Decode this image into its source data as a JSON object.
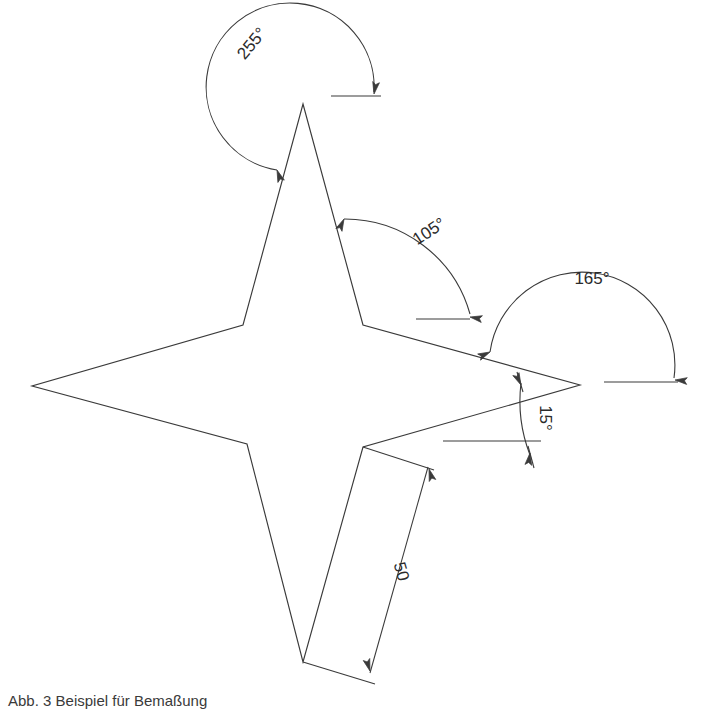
{
  "document": {
    "type": "engineering-line-drawing",
    "background_color": "#ffffff",
    "line_color": "#3a3a3a",
    "text_color": "#2b2b2b"
  },
  "shape": {
    "name": "four-pointed-star",
    "vertex_count": 8,
    "points": "303,104 363,325 580,385 363,447 303,662 247,444 32,386 243,325"
  },
  "dimensions": [
    {
      "id": "angle-255",
      "kind": "angular",
      "value": "255°",
      "text_x": 256,
      "text_y": 47,
      "text_rotation": -50,
      "arc_path": "M 277 170 A 84 84 0 1 1 374 92",
      "baseline": {
        "x1": 331,
        "y1": 96,
        "x2": 381,
        "y2": 96
      },
      "arrows": [
        {
          "x": 277,
          "y": 170,
          "rotation": 160
        },
        {
          "x": 374,
          "y": 94,
          "rotation": 10
        }
      ]
    },
    {
      "id": "angle-105",
      "kind": "angular",
      "value": "105°",
      "text_x": 432,
      "text_y": 236,
      "text_rotation": -33,
      "arc_path": "M 344 219 A 130 130 0 0 1 470 314",
      "baseline": {
        "x1": 416,
        "y1": 319,
        "x2": 470,
        "y2": 319
      },
      "arrows": [
        {
          "x": 344,
          "y": 219,
          "rotation": 205
        },
        {
          "x": 470,
          "y": 317,
          "rotation": 100
        }
      ]
    },
    {
      "id": "angle-165",
      "kind": "angular",
      "value": "165°",
      "text_x": 592,
      "text_y": 284,
      "text_rotation": 0,
      "arc_path": "M 490 352 A 92 92 0 0 1 674 378",
      "baseline": {
        "x1": 604,
        "y1": 382,
        "x2": 678,
        "y2": 382
      },
      "arrows": [
        {
          "x": 490,
          "y": 352,
          "rotation": 245
        },
        {
          "x": 675,
          "y": 380,
          "rotation": 95
        }
      ]
    },
    {
      "id": "angle-15",
      "kind": "angular",
      "value": "15°",
      "text_x": 540,
      "text_y": 418,
      "text_rotation": 90,
      "arc_path": "M 521 383 A 150 150 0 0 0 530 455",
      "baseline": {
        "x1": 443,
        "y1": 441,
        "x2": 541,
        "y2": 441
      },
      "arrows": [
        {
          "x": 521,
          "y": 385,
          "rotation": 335
        },
        {
          "x": 530,
          "y": 453,
          "rotation": 188
        }
      ]
    },
    {
      "id": "length-50",
      "kind": "linear",
      "value": "50",
      "text_x": 396,
      "text_y": 573,
      "text_rotation": 74,
      "dim_line": {
        "x1": 428,
        "y1": 467,
        "x2": 370,
        "y2": 673
      },
      "ext_line_1": {
        "x1": 363,
        "y1": 447,
        "x2": 434,
        "y2": 470
      },
      "ext_line_2": {
        "x1": 303,
        "y1": 662,
        "x2": 375,
        "y2": 684
      },
      "arrows": [
        {
          "x": 429,
          "y": 469,
          "rotation": 163
        },
        {
          "x": 370,
          "y": 671,
          "rotation": 343
        }
      ]
    }
  ],
  "caption": {
    "text": "Abb. 3 Beispiel für Bemaßung",
    "x": 8,
    "y": 706
  }
}
